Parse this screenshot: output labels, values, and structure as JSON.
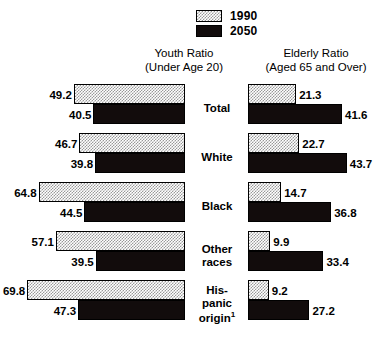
{
  "legend": {
    "items": [
      {
        "label": "1990",
        "swatch": "dither-swatch-1990",
        "color": "#999999"
      },
      {
        "label": "2050",
        "swatch": "solid-swatch-2050",
        "color": "#120c0c"
      }
    ]
  },
  "headers": {
    "youth": {
      "line1": "Youth Ratio",
      "line2": "(Under Age 20)"
    },
    "elderly": {
      "line1": "Elderly Ratio",
      "line2": "(Aged 65 and Over)"
    }
  },
  "categories": [
    {
      "lines": [
        "Total"
      ],
      "footnote": ""
    },
    {
      "lines": [
        "White"
      ],
      "footnote": ""
    },
    {
      "lines": [
        "Black"
      ],
      "footnote": ""
    },
    {
      "lines": [
        "Other",
        "races"
      ],
      "footnote": ""
    },
    {
      "lines": [
        "His-",
        "panic",
        "origin"
      ],
      "footnote": "1"
    }
  ],
  "youth": {
    "1990": [
      "49.2",
      "46.7",
      "64.8",
      "57.1",
      "69.8"
    ],
    "2050": [
      "40.5",
      "39.8",
      "44.5",
      "39.5",
      "47.3"
    ]
  },
  "elderly": {
    "1990": [
      "21.3",
      "22.7",
      "14.7",
      "9.9",
      "9.2"
    ],
    "2050": [
      "41.6",
      "43.7",
      "36.8",
      "33.4",
      "27.2"
    ]
  },
  "chart_data": {
    "type": "bar",
    "orientation": "horizontal-diverging",
    "title": "",
    "subtitle": "",
    "categories": [
      "Total",
      "White",
      "Black",
      "Other races",
      "Hispanic origin"
    ],
    "panels": [
      {
        "name": "Youth Ratio",
        "axis_label": "Youth Ratio (Under Age 20)",
        "direction": "left",
        "series": [
          {
            "name": "1990",
            "values": [
              49.2,
              46.7,
              64.8,
              57.1,
              69.8
            ]
          },
          {
            "name": "2050",
            "values": [
              40.5,
              39.8,
              44.5,
              39.5,
              47.3
            ]
          }
        ]
      },
      {
        "name": "Elderly Ratio",
        "axis_label": "Elderly Ratio (Aged 65 and Over)",
        "direction": "right",
        "series": [
          {
            "name": "1990",
            "values": [
              21.3,
              22.7,
              14.7,
              9.9,
              9.2
            ]
          },
          {
            "name": "2050",
            "values": [
              41.6,
              43.7,
              36.8,
              33.4,
              27.2
            ]
          }
        ]
      }
    ],
    "legend": [
      "1990",
      "2050"
    ],
    "legend_position": "top-center",
    "grid": false,
    "xlabel": "",
    "ylabel": "",
    "annotations": [
      "1"
    ],
    "px_per_unit": 2.26
  }
}
